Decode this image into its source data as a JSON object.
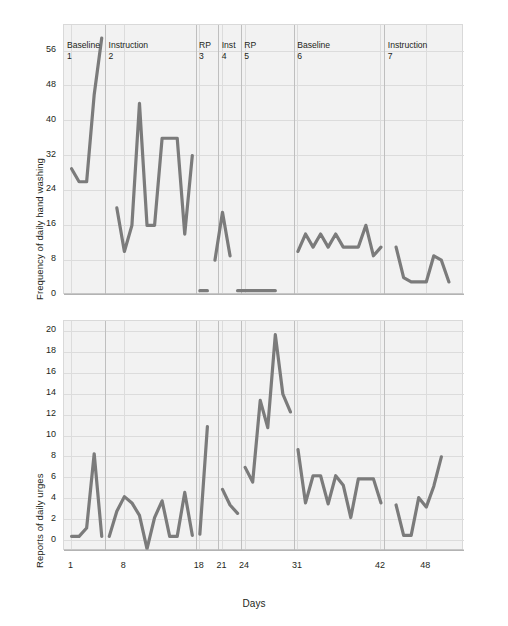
{
  "figure": {
    "xaxis_title": "Days",
    "x_ticks": [
      1,
      8,
      18,
      21,
      24,
      31,
      42,
      48
    ],
    "phases": [
      {
        "name": "Baseline",
        "number": "1"
      },
      {
        "name": "Instruction",
        "number": "2"
      },
      {
        "name": "RP",
        "number": "3"
      },
      {
        "name": "Inst",
        "number": "4"
      },
      {
        "name": "RP",
        "number": "5"
      },
      {
        "name": "Baseline",
        "number": "6"
      },
      {
        "name": "Instruction",
        "number": "7"
      }
    ],
    "line_color": "#7b7b7b",
    "panel_background": "#f2f2f2",
    "grid_color": "#dcdcdc"
  },
  "chart_data": [
    {
      "type": "line",
      "title": "",
      "xlabel": "Days",
      "ylabel": "Frequency of daily hand washing",
      "xlim": [
        0,
        53
      ],
      "ylim": [
        0,
        62
      ],
      "yticks": [
        0,
        8,
        16,
        24,
        32,
        40,
        48,
        56
      ],
      "xticks": [
        1,
        8,
        18,
        21,
        24,
        31,
        42,
        48
      ],
      "grid": true,
      "legend": "none",
      "phase_breaks": [
        5.5,
        17.5,
        20.5,
        23.5,
        30.5,
        42.5
      ],
      "series": [
        {
          "name": "Baseline 1",
          "x": [
            1,
            2,
            3,
            4,
            5
          ],
          "y": [
            29,
            26,
            26,
            46,
            59
          ]
        },
        {
          "name": "Instruction 2",
          "x": [
            7,
            8,
            9,
            10,
            11,
            12,
            13,
            14,
            15,
            16,
            17
          ],
          "y": [
            20,
            10,
            16,
            44,
            16,
            16,
            36,
            36,
            36,
            14,
            32
          ]
        },
        {
          "name": "RP 3",
          "x": [
            18,
            19
          ],
          "y": [
            1,
            1
          ]
        },
        {
          "name": "Inst 4",
          "x": [
            20,
            21,
            22
          ],
          "y": [
            8,
            19,
            9
          ]
        },
        {
          "name": "RP 5",
          "x": [
            23,
            24,
            25,
            26,
            27,
            28
          ],
          "y": [
            1,
            1,
            1,
            1,
            1,
            1
          ]
        },
        {
          "name": "Baseline 6",
          "x": [
            31,
            32,
            33,
            34,
            35,
            36,
            37,
            38,
            39,
            40,
            41,
            42
          ],
          "y": [
            10,
            14,
            11,
            14,
            11,
            14,
            11,
            11,
            11,
            16,
            9,
            11
          ]
        },
        {
          "name": "Instruction 7",
          "x": [
            44,
            45,
            46,
            47,
            48,
            49,
            50,
            51
          ],
          "y": [
            11,
            4,
            3,
            3,
            3,
            9,
            8,
            3
          ]
        }
      ]
    },
    {
      "type": "line",
      "title": "",
      "xlabel": "Days",
      "ylabel": "Reports of daily urges",
      "xlim": [
        0,
        53
      ],
      "ylim": [
        -1,
        21
      ],
      "yticks": [
        0,
        2,
        4,
        6,
        8,
        10,
        12,
        14,
        16,
        18,
        20
      ],
      "xticks": [
        1,
        8,
        18,
        21,
        24,
        31,
        42,
        48
      ],
      "grid": true,
      "legend": "none",
      "phase_breaks": [
        5.5,
        17.5,
        20.5,
        23.5,
        30.5,
        42.5
      ],
      "series": [
        {
          "name": "Baseline 1",
          "x": [
            1,
            2,
            3,
            4,
            5
          ],
          "y": [
            0.4,
            0.4,
            1.2,
            8.3,
            0.4
          ]
        },
        {
          "name": "Instruction 2",
          "x": [
            6,
            7,
            8,
            9,
            10,
            11,
            12,
            13,
            14,
            15,
            16,
            17
          ],
          "y": [
            0.4,
            2.8,
            4.2,
            3.6,
            2.4,
            -0.8,
            2.2,
            3.8,
            0.4,
            0.4,
            4.6,
            0.5
          ]
        },
        {
          "name": "RP 3",
          "x": [
            18,
            19
          ],
          "y": [
            0.6,
            10.9
          ]
        },
        {
          "name": "Inst 4",
          "x": [
            21,
            22,
            23
          ],
          "y": [
            4.9,
            3.4,
            2.6
          ]
        },
        {
          "name": "RP 5",
          "x": [
            24,
            25,
            26,
            27,
            28,
            29,
            30
          ],
          "y": [
            7.0,
            5.6,
            13.4,
            10.8,
            19.7,
            14.0,
            12.3
          ]
        },
        {
          "name": "Baseline 6",
          "x": [
            31,
            32,
            33,
            34,
            35,
            36,
            37,
            38,
            39,
            40,
            41,
            42
          ],
          "y": [
            8.7,
            3.6,
            6.2,
            6.2,
            3.5,
            6.2,
            5.3,
            2.2,
            5.9,
            5.9,
            5.9,
            3.6
          ]
        },
        {
          "name": "Instruction 7",
          "x": [
            44,
            45,
            46,
            47,
            48,
            49,
            50
          ],
          "y": [
            3.4,
            0.5,
            0.5,
            4.1,
            3.2,
            5.2,
            8.0
          ]
        }
      ]
    }
  ]
}
